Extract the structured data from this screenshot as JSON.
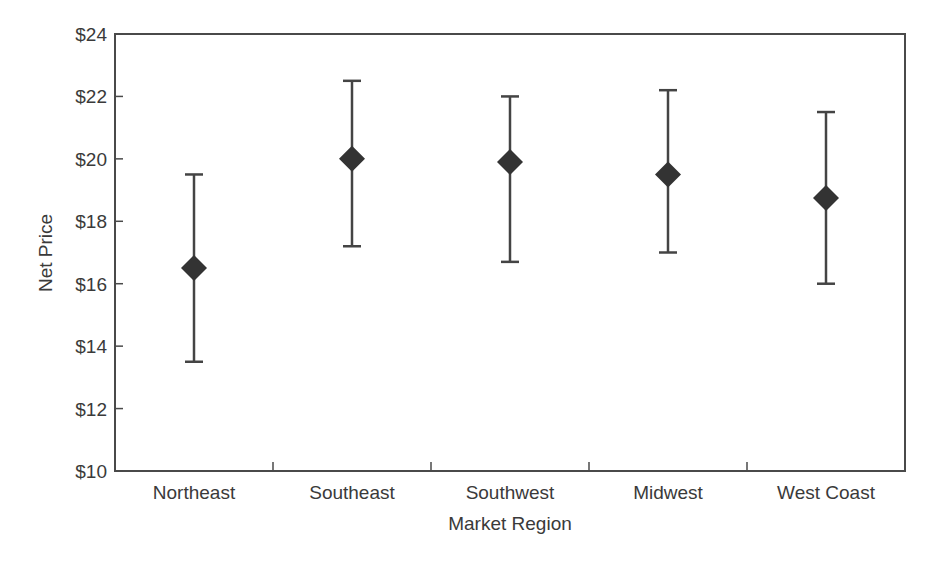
{
  "chart_data": {
    "type": "scatter",
    "subtype": "point-with-error-bars",
    "title": "",
    "xlabel": "Market Region",
    "ylabel": "Net Price",
    "categories": [
      "Northeast",
      "Southeast",
      "Southwest",
      "Midwest",
      "West Coast"
    ],
    "series": [
      {
        "name": "Net Price",
        "marker": "diamond",
        "values": [
          16.5,
          20.0,
          19.9,
          19.5,
          18.75
        ],
        "upper": [
          19.5,
          22.5,
          22.0,
          22.2,
          21.5
        ],
        "lower": [
          13.5,
          17.2,
          16.7,
          17.0,
          16.0
        ]
      }
    ],
    "ylim": [
      10,
      24
    ],
    "yticks": [
      10,
      12,
      14,
      16,
      18,
      20,
      22,
      24
    ],
    "ytick_labels": [
      "$10",
      "$12",
      "$14",
      "$16",
      "$18",
      "$20",
      "$22",
      "$24"
    ],
    "grid": false,
    "legend": "none"
  },
  "colors": {
    "axis": "#4a4a4a",
    "marker": "#333333",
    "errorbar": "#444444",
    "text": "#3a3a3a"
  },
  "layout": {
    "plot_left": 115,
    "plot_right": 905,
    "plot_top": 34,
    "plot_bottom": 471
  }
}
